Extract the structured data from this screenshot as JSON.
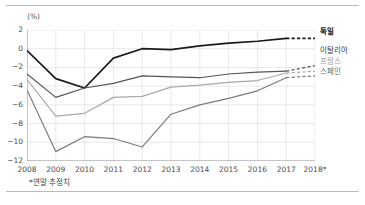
{
  "axis": {
    "unit_label": "(%)",
    "y_ticks": [
      "2",
      "0",
      "-2",
      "-4",
      "-6",
      "-8",
      "-10",
      "-12"
    ],
    "x_ticks": [
      "2008",
      "2009",
      "2010",
      "2011",
      "2012",
      "2013",
      "2014",
      "2015",
      "2016",
      "2017",
      "2018*"
    ]
  },
  "legend": {
    "germany": "독일",
    "italy": "이탈리아",
    "france": "프랑스",
    "spain": "스페인"
  },
  "footnote": "*연말 추정치",
  "colors": {
    "germany": "#1a1a1a",
    "italy": "#555559",
    "france": "#a8a8ad",
    "spain": "#7b7b80",
    "grid": "#d8d8dc",
    "axis": "#8d8d92",
    "rule": "#b9b9b9"
  },
  "chart_data": {
    "type": "line",
    "title": "",
    "subtitle": "",
    "xlabel": "",
    "ylabel": "(%)",
    "x": [
      "2008",
      "2009",
      "2010",
      "2011",
      "2012",
      "2013",
      "2014",
      "2015",
      "2016",
      "2017",
      "2018*"
    ],
    "ylim": [
      -12,
      2
    ],
    "xlim": [
      "2008",
      "2018*"
    ],
    "grid": true,
    "legend_position": "right",
    "annotations": [
      "*연말 추정치"
    ],
    "series": [
      {
        "name": "독일",
        "color": "#1a1a1a",
        "values": [
          -0.2,
          -3.2,
          -4.2,
          -1.0,
          0.0,
          -0.1,
          0.3,
          0.6,
          0.8,
          1.1,
          1.1
        ],
        "dashed_from": "2017"
      },
      {
        "name": "이탈리아",
        "color": "#555559",
        "values": [
          -2.7,
          -5.2,
          -4.2,
          -3.7,
          -2.9,
          -3.0,
          -3.1,
          -2.7,
          -2.5,
          -2.4,
          -1.8
        ],
        "dashed_from": "2017"
      },
      {
        "name": "프랑스",
        "color": "#a8a8ad",
        "values": [
          -3.3,
          -7.2,
          -6.9,
          -5.2,
          -5.1,
          -4.1,
          -3.9,
          -3.6,
          -3.4,
          -2.6,
          -2.4
        ],
        "dashed_from": "2017"
      },
      {
        "name": "스페인",
        "color": "#7b7b80",
        "values": [
          -4.4,
          -11.0,
          -9.4,
          -9.6,
          -10.5,
          -7.0,
          -6.0,
          -5.3,
          -4.5,
          -3.1,
          -2.9
        ],
        "dashed_from": "2017"
      }
    ]
  }
}
